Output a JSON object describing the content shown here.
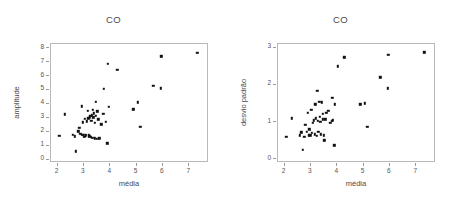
{
  "figure": {
    "background_color": "#ffffff",
    "width": 454,
    "height": 205,
    "panel_count": 2
  },
  "panels": [
    {
      "title": "CO",
      "xlabel": "média",
      "ylabel": "amplitude"
    },
    {
      "title": "CO",
      "xlabel": "média",
      "ylabel": "desvio padrão"
    }
  ],
  "chart_data": [
    {
      "type": "scatter",
      "title": "CO",
      "xlabel": "média",
      "ylabel": "amplitude",
      "xlim": [
        1.75,
        7.75
      ],
      "ylim": [
        -0.25,
        8.3
      ],
      "xticks": [
        2,
        3,
        4,
        5,
        6,
        7
      ],
      "yticks": [
        0,
        1,
        2,
        3,
        4,
        5,
        6,
        7,
        8
      ],
      "xticklabels": [
        "2",
        "3",
        "4",
        "5",
        "6",
        "7"
      ],
      "yticklabels": [
        "0",
        "1",
        "2",
        "3",
        "4",
        "5",
        "6",
        "7",
        "8"
      ],
      "grid": false,
      "legend": null,
      "marker": "square",
      "marker_color": "#111111",
      "points": [
        [
          2.1,
          1.62
        ],
        [
          2.32,
          3.17
        ],
        [
          2.62,
          1.72
        ],
        [
          2.7,
          1.6
        ],
        [
          2.72,
          0.53
        ],
        [
          2.82,
          1.95
        ],
        [
          2.86,
          2.22
        ],
        [
          2.9,
          1.78
        ],
        [
          2.95,
          3.75
        ],
        [
          2.97,
          1.72
        ],
        [
          3.0,
          2.6
        ],
        [
          3.02,
          1.7
        ],
        [
          3.05,
          1.55
        ],
        [
          3.08,
          2.85
        ],
        [
          3.1,
          1.72
        ],
        [
          3.12,
          1.62
        ],
        [
          3.15,
          2.68
        ],
        [
          3.18,
          3.42
        ],
        [
          3.2,
          2.9
        ],
        [
          3.22,
          1.7
        ],
        [
          3.24,
          1.6
        ],
        [
          3.26,
          2.95
        ],
        [
          3.28,
          3.05
        ],
        [
          3.3,
          1.58
        ],
        [
          3.32,
          2.72
        ],
        [
          3.34,
          3.1
        ],
        [
          3.36,
          1.5
        ],
        [
          3.38,
          3.52
        ],
        [
          3.4,
          2.95
        ],
        [
          3.42,
          3.25
        ],
        [
          3.44,
          1.45
        ],
        [
          3.46,
          2.55
        ],
        [
          3.48,
          3.05
        ],
        [
          3.5,
          4.08
        ],
        [
          3.52,
          1.42
        ],
        [
          3.55,
          3.4
        ],
        [
          3.58,
          2.82
        ],
        [
          3.62,
          1.45
        ],
        [
          3.7,
          2.45
        ],
        [
          3.78,
          3.2
        ],
        [
          3.8,
          5.02
        ],
        [
          3.88,
          2.65
        ],
        [
          3.92,
          1.1
        ],
        [
          3.95,
          6.8
        ],
        [
          3.98,
          3.72
        ],
        [
          4.3,
          6.38
        ],
        [
          4.92,
          3.55
        ],
        [
          5.08,
          4.05
        ],
        [
          5.18,
          2.28
        ],
        [
          5.68,
          5.22
        ],
        [
          5.95,
          5.05
        ],
        [
          5.98,
          7.35
        ],
        [
          7.35,
          7.6
        ]
      ]
    },
    {
      "type": "scatter",
      "title": "CO",
      "xlabel": "média",
      "ylabel": "desvio padrão",
      "xlim": [
        1.75,
        7.75
      ],
      "ylim": [
        -0.1,
        3.1
      ],
      "xticks": [
        2,
        3,
        4,
        5,
        6,
        7
      ],
      "yticks": [
        0,
        1,
        2,
        3
      ],
      "xticklabels": [
        "2",
        "3",
        "4",
        "5",
        "6",
        "7"
      ],
      "yticklabels": [
        "0",
        "1",
        "2",
        "3"
      ],
      "grid": false,
      "legend": null,
      "marker": "square",
      "marker_color": "#111111",
      "points": [
        [
          2.1,
          0.58
        ],
        [
          2.32,
          1.08
        ],
        [
          2.62,
          0.62
        ],
        [
          2.68,
          0.7
        ],
        [
          2.72,
          0.22
        ],
        [
          2.78,
          0.58
        ],
        [
          2.82,
          0.9
        ],
        [
          2.88,
          0.72
        ],
        [
          2.92,
          1.22
        ],
        [
          2.95,
          0.62
        ],
        [
          2.98,
          0.78
        ],
        [
          3.02,
          0.62
        ],
        [
          3.05,
          1.3
        ],
        [
          3.08,
          0.68
        ],
        [
          3.12,
          0.95
        ],
        [
          3.15,
          1.02
        ],
        [
          3.18,
          0.65
        ],
        [
          3.2,
          1.45
        ],
        [
          3.22,
          1.08
        ],
        [
          3.25,
          0.6
        ],
        [
          3.28,
          1.82
        ],
        [
          3.3,
          1.0
        ],
        [
          3.32,
          0.72
        ],
        [
          3.35,
          1.52
        ],
        [
          3.38,
          1.12
        ],
        [
          3.4,
          0.98
        ],
        [
          3.42,
          0.65
        ],
        [
          3.45,
          1.51
        ],
        [
          3.48,
          1.05
        ],
        [
          3.5,
          1.2
        ],
        [
          3.52,
          0.62
        ],
        [
          3.55,
          0.48
        ],
        [
          3.58,
          1.05
        ],
        [
          3.62,
          1.22
        ],
        [
          3.7,
          1.28
        ],
        [
          3.78,
          0.95
        ],
        [
          3.82,
          1.0
        ],
        [
          3.85,
          1.62
        ],
        [
          3.88,
          1.02
        ],
        [
          3.92,
          0.35
        ],
        [
          3.95,
          1.45
        ],
        [
          4.05,
          2.47
        ],
        [
          4.3,
          2.72
        ],
        [
          4.92,
          1.45
        ],
        [
          5.08,
          1.48
        ],
        [
          5.18,
          0.85
        ],
        [
          5.68,
          2.18
        ],
        [
          5.95,
          1.88
        ],
        [
          5.98,
          2.78
        ],
        [
          7.35,
          2.85
        ]
      ]
    }
  ]
}
